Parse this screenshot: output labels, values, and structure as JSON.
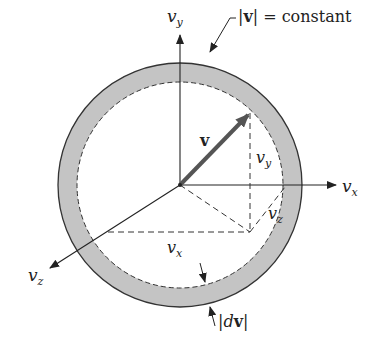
{
  "diagram": {
    "colors": {
      "shell": "#c8c8c8",
      "line": "#333333",
      "vector": "#555555",
      "background": "#ffffff"
    },
    "axes": {
      "vy_label": "v",
      "vy_sub": "y",
      "vx_label": "v",
      "vx_sub": "x",
      "vz_label": "v",
      "vz_sub": "z"
    },
    "vector": {
      "label": "v"
    },
    "components": {
      "vy": {
        "label": "v",
        "sub": "y"
      },
      "vx": {
        "label": "v",
        "sub": "x"
      },
      "vz": {
        "label": "v",
        "sub": "z"
      }
    },
    "annotations": {
      "constant_bar_open": "|",
      "constant_bold": "v",
      "constant_rest": "| = constant",
      "dv_open": "|",
      "dv_d": "d",
      "dv_bold": "v",
      "dv_close": "|"
    }
  }
}
